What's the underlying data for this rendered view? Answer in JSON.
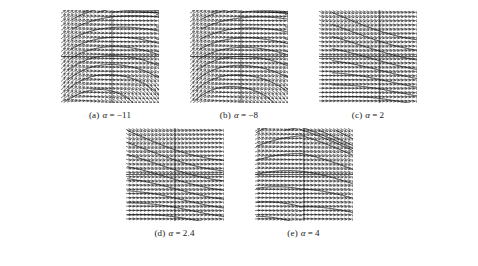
{
  "figure": {
    "type": "vector-field-panels",
    "background_color": "#ffffff",
    "ink_color": "#1a1a1a",
    "panel_count": 5,
    "rows": [
      3,
      2
    ]
  },
  "panels": [
    {
      "id": "a",
      "caption_label": "(a)",
      "caption_symbol": "α",
      "caption_eq": "=",
      "caption_value": "−11",
      "caption_full": "(a) α = −11",
      "field_kind": "spiral-focus",
      "axes": {
        "x_axis": true,
        "y_axis": true,
        "origin_x_frac": 0.52,
        "origin_y_frac": 0.5
      },
      "grid": {
        "cols": 26,
        "rows": 22
      },
      "alpha": -11
    },
    {
      "id": "b",
      "caption_label": "(b)",
      "caption_symbol": "α",
      "caption_eq": "=",
      "caption_value": "−8",
      "caption_full": "(b) α = −8",
      "field_kind": "spiral-focus",
      "axes": {
        "x_axis": true,
        "y_axis": true,
        "origin_x_frac": 0.52,
        "origin_y_frac": 0.5
      },
      "grid": {
        "cols": 26,
        "rows": 22
      },
      "alpha": -8
    },
    {
      "id": "c",
      "caption_label": "(c)",
      "caption_symbol": "α",
      "caption_eq": "=",
      "caption_value": "2",
      "caption_full": "(c) α = 2",
      "field_kind": "sheared-node",
      "axes": {
        "x_axis": true,
        "y_axis": true,
        "origin_x_frac": 0.62,
        "origin_y_frac": 0.5
      },
      "grid": {
        "cols": 26,
        "rows": 22
      },
      "alpha": 2
    },
    {
      "id": "d",
      "caption_label": "(d)",
      "caption_symbol": "α",
      "caption_eq": "=",
      "caption_value": "2.4",
      "caption_full": "(d) α = 2.4",
      "field_kind": "sheared-node",
      "axes": {
        "x_axis": true,
        "y_axis": true,
        "origin_x_frac": 0.5,
        "origin_y_frac": 0.5
      },
      "grid": {
        "cols": 26,
        "rows": 22
      },
      "alpha": 2.4
    },
    {
      "id": "e",
      "caption_label": "(e)",
      "caption_symbol": "α",
      "caption_eq": "=",
      "caption_value": "4",
      "caption_full": "(e) α = 4",
      "field_kind": "saddle",
      "axes": {
        "x_axis": true,
        "y_axis": true,
        "origin_x_frac": 0.5,
        "origin_y_frac": 0.5
      },
      "grid": {
        "cols": 26,
        "rows": 22
      },
      "alpha": 4
    }
  ],
  "chart_data": {
    "type": "scatter",
    "title": "",
    "xlabel": "",
    "ylabel": "",
    "subplots": [
      {
        "id": "a",
        "label": "(a) α = −11",
        "parameter": "α",
        "value": -11,
        "phase_portrait": "spiral focus with incoming/outgoing winding arms around the origin"
      },
      {
        "id": "b",
        "label": "(b) α = −8",
        "parameter": "α",
        "value": -8,
        "phase_portrait": "spiral focus, looser winding than (a)"
      },
      {
        "id": "c",
        "label": "(c) α = 2",
        "parameter": "α",
        "value": 2,
        "phase_portrait": "near-horizontal field with diagonal shear streaks"
      },
      {
        "id": "d",
        "label": "(d) α = 2.4",
        "parameter": "α",
        "value": 2.4,
        "phase_portrait": "near-horizontal field with stronger diagonal shear bands"
      },
      {
        "id": "e",
        "label": "(e) α = 4",
        "parameter": "α",
        "value": 4,
        "phase_portrait": "saddle-like structure with separatrix bands crossing the origin"
      }
    ]
  }
}
